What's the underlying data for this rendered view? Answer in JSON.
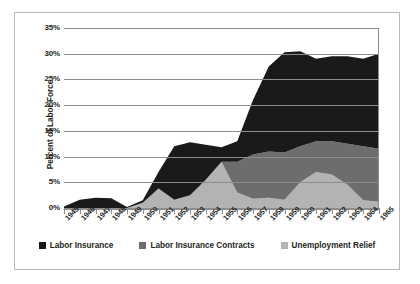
{
  "chart_data": {
    "type": "area",
    "stacked": true,
    "title": "",
    "xlabel": "",
    "ylabel": "Percent of Labor Force",
    "ylim": [
      0,
      35
    ],
    "ytick_labels": [
      "0%",
      "5%",
      "10%",
      "15%",
      "20%",
      "25%",
      "30%",
      "35%"
    ],
    "ytick_values": [
      0,
      5,
      10,
      15,
      20,
      25,
      30,
      35
    ],
    "grid": true,
    "legend_position": "bottom",
    "categories": [
      "1945",
      "1946",
      "1947",
      "1948",
      "1949",
      "1950",
      "1951",
      "1952",
      "1953",
      "1954",
      "1955",
      "1956",
      "1957",
      "1958",
      "1959",
      "1960",
      "1961",
      "1962",
      "1963",
      "1964",
      "1965"
    ],
    "series": [
      {
        "name": "Unemployment Relief",
        "color": "#b3b3b3",
        "values": [
          0,
          0,
          0,
          0,
          0,
          1.0,
          3.8,
          1.6,
          2.5,
          5.5,
          9.0,
          3.0,
          1.8,
          2.0,
          1.6,
          5.0,
          7.0,
          6.5,
          4.5,
          1.5,
          1.2
        ]
      },
      {
        "name": "Labor Insurance Contracts",
        "color": "#6d6d6d",
        "values": [
          0,
          0,
          0,
          0,
          0,
          0,
          0,
          0,
          0,
          0,
          0,
          6.0,
          8.6,
          9.0,
          9.2,
          7.0,
          6.0,
          6.5,
          8.0,
          10.5,
          10.3
        ]
      },
      {
        "name": "Labor Insurance",
        "color": "#1a1a1a",
        "values": [
          0.3,
          1.6,
          2.0,
          1.9,
          0.2,
          0.5,
          3.2,
          10.4,
          10.3,
          6.8,
          2.8,
          4.0,
          10.6,
          16.5,
          19.5,
          18.5,
          16.0,
          16.5,
          17.0,
          17.0,
          18.5
        ]
      }
    ],
    "totals": [
      0.3,
      1.6,
      2.0,
      1.9,
      0.2,
      1.5,
      7.0,
      12.0,
      12.8,
      12.3,
      11.8,
      13.0,
      21.0,
      27.5,
      30.3,
      30.5,
      29.0,
      29.5,
      29.5,
      29.0,
      30.0
    ]
  },
  "legend": {
    "items": [
      {
        "label": "Labor Insurance",
        "color": "#1a1a1a"
      },
      {
        "label": "Labor Insurance Contracts",
        "color": "#6d6d6d"
      },
      {
        "label": "Unemployment Relief",
        "color": "#b3b3b3"
      }
    ]
  },
  "axis": {
    "y_title": "Percent of Labor Force"
  }
}
